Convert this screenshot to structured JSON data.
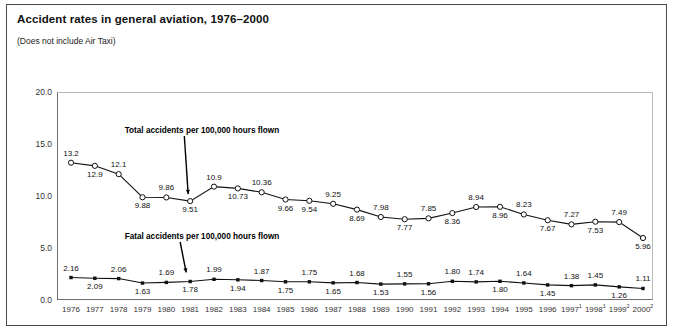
{
  "title": "Accident rates in general aviation, 1976–2000",
  "subtitle": "(Does not include Air Taxi)",
  "annotations": {
    "total": "Total accidents per 100,000 hours flown",
    "fatal": "Fatal accidents per 100,000 hours flown"
  },
  "colors": {
    "line": "#111111",
    "frame": "#4a4a4a",
    "axis": "#6f6f6f",
    "text": "#111111"
  },
  "chart_data": {
    "type": "line",
    "title": "Accident rates in general aviation, 1976–2000",
    "subtitle": "(Does not include Air Taxi)",
    "xlabel": "",
    "ylabel": "",
    "ylim": [
      0.0,
      20.0
    ],
    "yticks": [
      "0.0",
      "5.0",
      "10.0",
      "15.0",
      "20.0"
    ],
    "ytick_values": [
      0.0,
      5.0,
      10.0,
      15.0,
      20.0
    ],
    "grid": false,
    "legend": "inline-annotations",
    "categories": [
      "1976",
      "1977",
      "1978",
      "1979",
      "1980",
      "1981",
      "1982",
      "1983",
      "1984",
      "1985",
      "1986",
      "1987",
      "1988",
      "1989",
      "1990",
      "1991",
      "1992",
      "1993",
      "1994",
      "1995",
      "1996",
      "1997",
      "1998",
      "1999",
      "2000"
    ],
    "category_footnotes": [
      "",
      "",
      "",
      "",
      "",
      "",
      "",
      "",
      "",
      "",
      "",
      "",
      "",
      "",
      "",
      "",
      "",
      "",
      "",
      "",
      "",
      "1",
      "1",
      "2",
      "2"
    ],
    "series": [
      {
        "name": "Total accidents per 100,000 hours flown",
        "marker": "open-circle",
        "values": [
          13.2,
          12.9,
          12.1,
          9.88,
          9.86,
          9.51,
          10.9,
          10.73,
          10.36,
          9.66,
          9.54,
          9.25,
          8.69,
          7.98,
          7.77,
          7.85,
          8.36,
          8.94,
          8.96,
          8.23,
          7.67,
          7.27,
          7.53,
          7.49,
          5.96
        ],
        "labels": [
          "13.2",
          "12.9",
          "12.1",
          "9.88",
          "9.86",
          "9.51",
          "10.9",
          "10.73",
          "10.36",
          "9.66",
          "9.54",
          "9.25",
          "8.69",
          "7.98",
          "7.77",
          "7.85",
          "8.36",
          "8.94",
          "8.96",
          "8.23",
          "7.67",
          "7.27",
          "7.53",
          "7.49",
          "5.96"
        ],
        "label_pos": [
          "above",
          "below",
          "above",
          "below",
          "above",
          "below",
          "above",
          "below",
          "above",
          "below",
          "below",
          "above",
          "below",
          "above",
          "below",
          "above",
          "below",
          "above",
          "below",
          "above",
          "below",
          "above",
          "below",
          "above",
          "below"
        ]
      },
      {
        "name": "Fatal accidents per 100,000 hours flown",
        "marker": "filled-square",
        "values": [
          2.16,
          2.09,
          2.06,
          1.63,
          1.69,
          1.78,
          1.99,
          1.94,
          1.87,
          1.75,
          1.75,
          1.65,
          1.68,
          1.53,
          1.55,
          1.56,
          1.8,
          1.74,
          1.8,
          1.64,
          1.45,
          1.38,
          1.45,
          1.26,
          1.11
        ],
        "labels": [
          "2.16",
          "2.09",
          "2.06",
          "1.63",
          "1.69",
          "1.78",
          "1.99",
          "1.94",
          "1.87",
          "1.75",
          "1.75",
          "1.65",
          "1.68",
          "1.53",
          "1.55",
          "1.56",
          "1.80",
          "1.74",
          "1.80",
          "1.64",
          "1.45",
          "1.38",
          "1.45",
          "1.26",
          "1.11"
        ],
        "label_pos": [
          "above",
          "below",
          "above",
          "below",
          "above",
          "below",
          "above",
          "below",
          "above",
          "below",
          "above",
          "below",
          "above",
          "below",
          "above",
          "below",
          "above",
          "above",
          "below",
          "above",
          "below",
          "above",
          "above",
          "below",
          "above"
        ]
      }
    ]
  }
}
